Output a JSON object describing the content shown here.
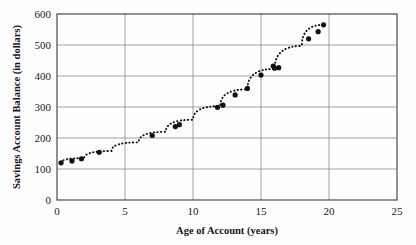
{
  "chart_data": {
    "type": "scatter",
    "title": "",
    "xlabel": "Age of Account (years)",
    "ylabel": "Savings Account Balance (in dollars)",
    "xlim": [
      0,
      25
    ],
    "ylim": [
      0,
      600
    ],
    "xticks": [
      0,
      5,
      10,
      15,
      20,
      25
    ],
    "yticks": [
      0,
      100,
      200,
      300,
      400,
      500,
      600
    ],
    "xtick_labels": [
      "0",
      "5",
      "10",
      "15",
      "20",
      "25"
    ],
    "ytick_labels": [
      "0",
      "100",
      "200",
      "300",
      "400",
      "500",
      "600"
    ],
    "grid": true,
    "grid_color": "#8a8a8a",
    "legend": "none",
    "marker_color": "#111111",
    "marker_shape": "circle",
    "curve_style": "dotted",
    "curve_color": "#111111",
    "points": [
      {
        "x": 0.3,
        "y": 120
      },
      {
        "x": 1.1,
        "y": 126
      },
      {
        "x": 1.8,
        "y": 133
      },
      {
        "x": 3.1,
        "y": 154
      },
      {
        "x": 7.0,
        "y": 208
      },
      {
        "x": 8.7,
        "y": 237
      },
      {
        "x": 9.0,
        "y": 243
      },
      {
        "x": 11.8,
        "y": 299
      },
      {
        "x": 12.2,
        "y": 306
      },
      {
        "x": 13.1,
        "y": 339
      },
      {
        "x": 14.0,
        "y": 360
      },
      {
        "x": 15.0,
        "y": 403
      },
      {
        "x": 15.9,
        "y": 432
      },
      {
        "x": 16.0,
        "y": 425
      },
      {
        "x": 16.3,
        "y": 427
      },
      {
        "x": 18.5,
        "y": 520
      },
      {
        "x": 19.2,
        "y": 543
      },
      {
        "x": 19.6,
        "y": 565
      }
    ],
    "fit_curve": [
      {
        "x": 0.3,
        "y": 120
      },
      {
        "x": 2.0,
        "y": 135
      },
      {
        "x": 4.0,
        "y": 158
      },
      {
        "x": 6.0,
        "y": 186
      },
      {
        "x": 8.0,
        "y": 220
      },
      {
        "x": 10.0,
        "y": 259
      },
      {
        "x": 12.0,
        "y": 303
      },
      {
        "x": 14.0,
        "y": 357
      },
      {
        "x": 16.0,
        "y": 423
      },
      {
        "x": 18.0,
        "y": 497
      },
      {
        "x": 19.6,
        "y": 565
      }
    ]
  },
  "axes": {
    "x_title": "Age of Account (years)",
    "y_title": "Savings Account Balance (in dollars)"
  }
}
